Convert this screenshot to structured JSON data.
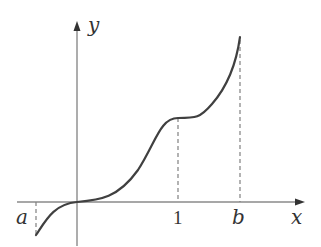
{
  "figure": {
    "axes": {
      "x_label": "x",
      "y_label": "y"
    },
    "ticks": [
      {
        "label": "a",
        "style": "italic"
      },
      {
        "label": "1",
        "style": "normal"
      },
      {
        "label": "b",
        "style": "italic"
      }
    ],
    "colors": {
      "axis": "#8a8a8a",
      "curve": "#404040",
      "dashed": "#808080",
      "text": "#333333"
    }
  }
}
